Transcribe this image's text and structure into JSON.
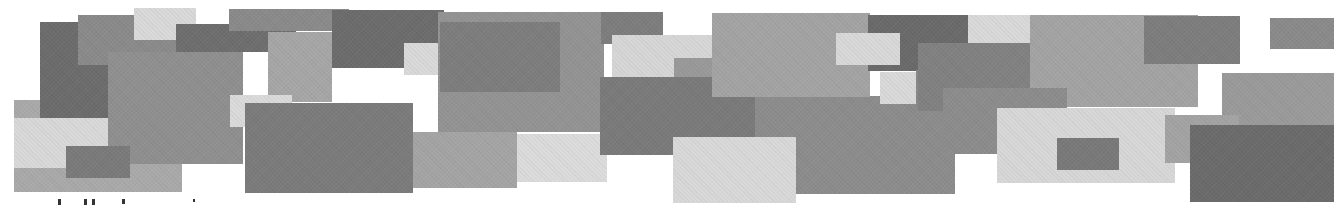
{
  "figure": {
    "background": "#ffffff",
    "rectangles": [
      {
        "x": 14,
        "y": 100,
        "w": 168,
        "h": 92,
        "color": "#a9a9a9"
      },
      {
        "x": 14,
        "y": 118,
        "w": 96,
        "h": 50,
        "color": "#d8d8d8"
      },
      {
        "x": 40,
        "y": 22,
        "w": 68,
        "h": 96,
        "color": "#6c6c6c"
      },
      {
        "x": 78,
        "y": 15,
        "w": 98,
        "h": 50,
        "color": "#8a8a8a"
      },
      {
        "x": 134,
        "y": 8,
        "w": 62,
        "h": 32,
        "color": "#d9d9d9"
      },
      {
        "x": 176,
        "y": 24,
        "w": 120,
        "h": 28,
        "color": "#6e6e6e"
      },
      {
        "x": 108,
        "y": 52,
        "w": 135,
        "h": 112,
        "color": "#8f8f8f"
      },
      {
        "x": 66,
        "y": 146,
        "w": 64,
        "h": 32,
        "color": "#7a7a7a"
      },
      {
        "x": 229,
        "y": 9,
        "w": 120,
        "h": 22,
        "color": "#8a8a8a"
      },
      {
        "x": 268,
        "y": 32,
        "w": 64,
        "h": 70,
        "color": "#a6a6a6"
      },
      {
        "x": 332,
        "y": 10,
        "w": 112,
        "h": 58,
        "color": "#6c6c6c"
      },
      {
        "x": 404,
        "y": 43,
        "w": 62,
        "h": 32,
        "color": "#d9d9d9"
      },
      {
        "x": 438,
        "y": 12,
        "w": 166,
        "h": 120,
        "color": "#939393"
      },
      {
        "x": 440,
        "y": 22,
        "w": 120,
        "h": 70,
        "color": "#7d7d7d"
      },
      {
        "x": 230,
        "y": 95,
        "w": 62,
        "h": 32,
        "color": "#dadada"
      },
      {
        "x": 245,
        "y": 103,
        "w": 168,
        "h": 90,
        "color": "#7b7b7b"
      },
      {
        "x": 413,
        "y": 132,
        "w": 104,
        "h": 56,
        "color": "#a4a4a4"
      },
      {
        "x": 517,
        "y": 134,
        "w": 90,
        "h": 48,
        "color": "#dbdbdb"
      },
      {
        "x": 601,
        "y": 12,
        "w": 62,
        "h": 32,
        "color": "#7d7d7d"
      },
      {
        "x": 612,
        "y": 35,
        "w": 100,
        "h": 42,
        "color": "#d6d6d6"
      },
      {
        "x": 674,
        "y": 58,
        "w": 44,
        "h": 20,
        "color": "#999999"
      },
      {
        "x": 600,
        "y": 77,
        "w": 155,
        "h": 78,
        "color": "#7a7a7a"
      },
      {
        "x": 755,
        "y": 96,
        "w": 200,
        "h": 98,
        "color": "#8c8c8c"
      },
      {
        "x": 712,
        "y": 13,
        "w": 158,
        "h": 84,
        "color": "#a3a3a3"
      },
      {
        "x": 868,
        "y": 15,
        "w": 100,
        "h": 56,
        "color": "#6a6a6a"
      },
      {
        "x": 836,
        "y": 33,
        "w": 64,
        "h": 32,
        "color": "#d8d8d8"
      },
      {
        "x": 880,
        "y": 72,
        "w": 36,
        "h": 32,
        "color": "#d9d9d9"
      },
      {
        "x": 916,
        "y": 70,
        "w": 32,
        "h": 40,
        "color": "#888888"
      },
      {
        "x": 673,
        "y": 137,
        "w": 123,
        "h": 66,
        "color": "#d8d8d8"
      },
      {
        "x": 968,
        "y": 15,
        "w": 62,
        "h": 28,
        "color": "#d9d9d9"
      },
      {
        "x": 918,
        "y": 43,
        "w": 112,
        "h": 68,
        "color": "#818181"
      },
      {
        "x": 1030,
        "y": 15,
        "w": 168,
        "h": 92,
        "color": "#a3a3a3"
      },
      {
        "x": 943,
        "y": 88,
        "w": 124,
        "h": 66,
        "color": "#8c8c8c"
      },
      {
        "x": 997,
        "y": 108,
        "w": 178,
        "h": 75,
        "color": "#d7d7d7"
      },
      {
        "x": 1057,
        "y": 138,
        "w": 62,
        "h": 32,
        "color": "#797979"
      },
      {
        "x": 1144,
        "y": 16,
        "w": 96,
        "h": 48,
        "color": "#7d7d7d"
      },
      {
        "x": 1270,
        "y": 18,
        "w": 64,
        "h": 31,
        "color": "#8a8a8a"
      },
      {
        "x": 1222,
        "y": 73,
        "w": 112,
        "h": 52,
        "color": "#9a9a9a"
      },
      {
        "x": 1165,
        "y": 115,
        "w": 74,
        "h": 48,
        "color": "#a3a3a3"
      },
      {
        "x": 1190,
        "y": 125,
        "w": 144,
        "h": 77,
        "color": "#6b6b6b"
      }
    ]
  },
  "caption": {
    "text": "",
    "note": "cropped text line at bottom edge — glyph tops only, illegible"
  }
}
